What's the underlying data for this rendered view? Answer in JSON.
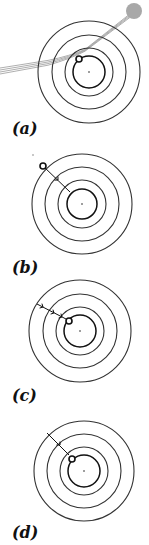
{
  "figure": {
    "width": 149,
    "height": 545,
    "colors": {
      "ring": "#333333",
      "inner_ring": "#111111",
      "trail": "#9a9a9a",
      "ball": "#a8a8a8",
      "marker": "#111111"
    },
    "panels": [
      {
        "id": "a",
        "label": "(a)",
        "label_pos": [
          12,
          134
        ],
        "center": [
          89,
          72
        ],
        "rings": [
          51,
          37,
          24
        ],
        "inner_ring": 16,
        "marker": [
          79,
          59
        ],
        "incoming_trail": true,
        "ball": [
          134,
          11,
          8
        ],
        "arrows": []
      },
      {
        "id": "b",
        "label": "(b)",
        "label_pos": [
          12,
          273
        ],
        "center": [
          82,
          204
        ],
        "rings": [
          50,
          37,
          24
        ],
        "inner_ring": 15,
        "marker": [
          43,
          166
        ],
        "stray_dot": [
          33,
          155
        ],
        "arrows": [
          {
            "from": [
              43,
              166
            ],
            "to": [
              70,
              192
            ],
            "arrowheads": [
              [
                58,
                180
              ]
            ]
          }
        ]
      },
      {
        "id": "c",
        "label": "(c)",
        "label_pos": [
          12,
          401
        ],
        "center": [
          80,
          331
        ],
        "rings": [
          51,
          37,
          24
        ],
        "inner_ring": 16,
        "marker": [
          69,
          321
        ],
        "arrows": [
          {
            "from": [
              37,
              304
            ],
            "to": [
              66,
              319
            ],
            "arrowheads": [
              [
                43,
                307
              ],
              [
                54,
                313
              ],
              [
                62,
                317
              ]
            ]
          }
        ]
      },
      {
        "id": "d",
        "label": "(d)",
        "label_pos": [
          12,
          538
        ],
        "center": [
          84,
          471
        ],
        "rings": [
          50,
          37,
          24
        ],
        "inner_ring": 16,
        "marker": [
          72,
          459
        ],
        "arrows": [
          {
            "from": [
              47,
              433
            ],
            "to": [
              69,
              455
            ],
            "arrowheads": [
              [
                60,
                445
              ]
            ]
          }
        ]
      }
    ]
  }
}
